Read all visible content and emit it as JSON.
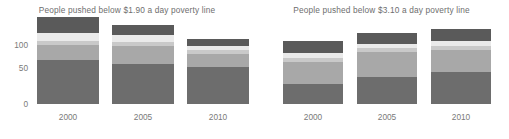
{
  "chart_data": [
    {
      "type": "bar",
      "title": "People pushed below $1.90 a day poverty line",
      "xlabel": "",
      "ylabel": "",
      "stacked": true,
      "grid": false,
      "legend": "none",
      "ylim": [
        0,
        135
      ],
      "yticks": [
        0,
        50,
        100
      ],
      "ytick_labels": [
        "0",
        "50",
        "100"
      ],
      "categories": [
        "2000",
        "2005",
        "2010"
      ],
      "series": [
        {
          "name": "series-1",
          "color": "#6d6d6d",
          "values": [
            65,
            59,
            54
          ]
        },
        {
          "name": "series-2",
          "color": "#a8a8a8",
          "values": [
            22,
            26,
            20
          ]
        },
        {
          "name": "series-3",
          "color": "#c9c9c9",
          "values": [
            6,
            6,
            6
          ]
        },
        {
          "name": "series-4",
          "color": "#eaeaea",
          "values": [
            12,
            10,
            6
          ]
        },
        {
          "name": "series-5",
          "color": "#5a5a5a",
          "values": [
            23,
            15,
            10
          ]
        }
      ],
      "totals": [
        128,
        116,
        96
      ]
    },
    {
      "type": "bar",
      "title": "People pushed below $3.10 a day poverty line",
      "xlabel": "",
      "ylabel": "",
      "stacked": true,
      "grid": false,
      "legend": "none",
      "ylim": [
        0,
        135
      ],
      "yticks": [
        0,
        50,
        100
      ],
      "ytick_labels": [
        "0",
        "50",
        "100"
      ],
      "categories": [
        "2000",
        "2005",
        "2010"
      ],
      "series": [
        {
          "name": "series-1",
          "color": "#6d6d6d",
          "values": [
            30,
            40,
            47
          ]
        },
        {
          "name": "series-2",
          "color": "#a8a8a8",
          "values": [
            32,
            37,
            32
          ]
        },
        {
          "name": "series-3",
          "color": "#c9c9c9",
          "values": [
            6,
            6,
            7
          ]
        },
        {
          "name": "series-4",
          "color": "#eaeaea",
          "values": [
            7,
            5,
            7
          ]
        },
        {
          "name": "series-5",
          "color": "#5a5a5a",
          "values": [
            18,
            17,
            17
          ]
        }
      ],
      "totals": [
        93,
        105,
        110
      ]
    }
  ],
  "left": {
    "title": "People pushed below $1.90 a day poverty line",
    "yticks": [
      "100",
      "50",
      "0"
    ],
    "xlabels": [
      "2000",
      "2005",
      "2010"
    ]
  },
  "right": {
    "title": "People pushed below $3.10 a day poverty line",
    "yticks": [],
    "xlabels": [
      "2000",
      "2005",
      "2010"
    ]
  },
  "colors": {
    "bottom": "#6d6d6d",
    "mid_light": "#a8a8a8",
    "band_light": "#c9c9c9",
    "band_pale": "#eaeaea",
    "cap_dark": "#5a5a5a",
    "text": "#6e6e6e",
    "background": "#ffffff"
  }
}
